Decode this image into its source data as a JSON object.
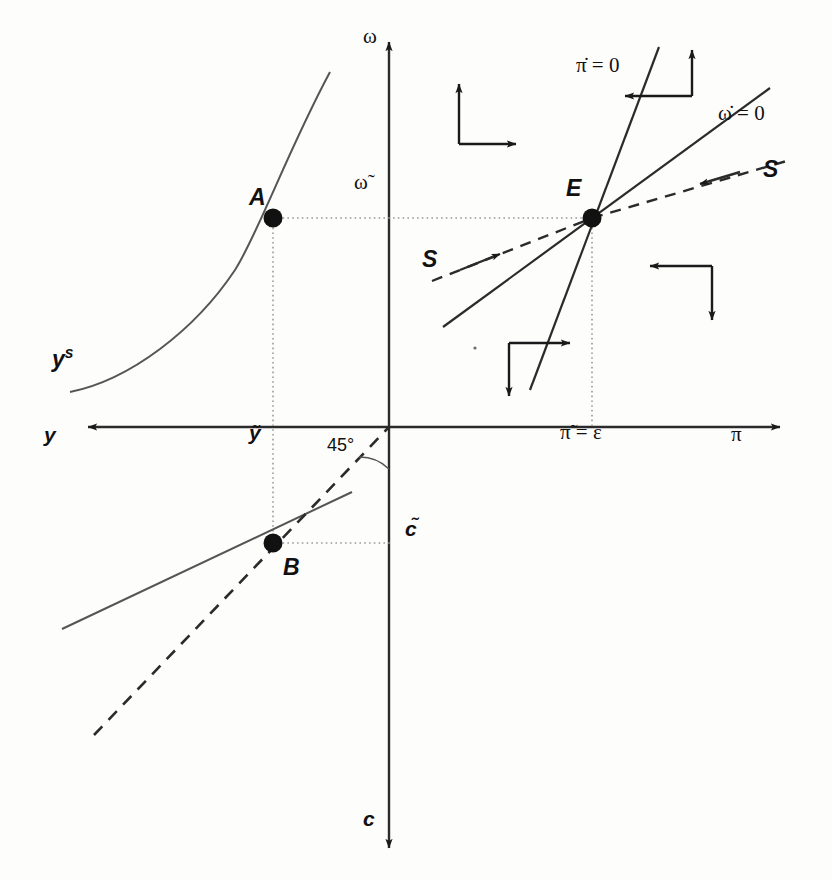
{
  "figure": {
    "type": "phase-diagram"
  },
  "axes": [
    {
      "id": "y",
      "label": "y",
      "direction": "left",
      "label_x": 44,
      "label_y": 434
    },
    {
      "id": "pi",
      "label": "π",
      "direction": "right",
      "label_x": 731,
      "label_y": 434
    },
    {
      "id": "omega",
      "label": "ω",
      "direction": "up",
      "label_x": 363,
      "label_y": 36
    },
    {
      "id": "c",
      "label": "c",
      "direction": "down",
      "label_x": 363,
      "label_y": 818
    }
  ],
  "ticks": [
    {
      "id": "y-tilde",
      "label": "ỹ",
      "x": 249,
      "y": 432
    },
    {
      "id": "pi-tilde",
      "label": "π̃ = ε",
      "x": 560,
      "y": 432
    },
    {
      "id": "omega-tilde",
      "label": "ω̃",
      "x": 354,
      "y": 180
    },
    {
      "id": "c-tilde",
      "label": "c̃",
      "x": 405,
      "y": 518
    }
  ],
  "points": [
    {
      "id": "A",
      "label": "A",
      "cx": 273,
      "cy": 218,
      "label_x": 249,
      "label_y": 186
    },
    {
      "id": "B",
      "label": "B",
      "cx": 273,
      "cy": 543,
      "label_x": 283,
      "label_y": 556
    },
    {
      "id": "E",
      "label": "E",
      "cx": 592,
      "cy": 218,
      "label_x": 566,
      "label_y": 177
    }
  ],
  "curves": [
    {
      "id": "y-supply",
      "label": "y",
      "superscript": "s",
      "label_x": 52,
      "label_y": 345,
      "style": "solid"
    },
    {
      "id": "pi-dot-nullcline",
      "label": "π̇ = 0",
      "label_x": 576,
      "label_y": 55,
      "style": "solid"
    },
    {
      "id": "omega-dot-nullcline",
      "label": "ω̇ = 0",
      "label_x": 718,
      "label_y": 103,
      "style": "solid"
    },
    {
      "id": "saddle-path-right",
      "label": "S",
      "label_x": 763,
      "label_y": 158,
      "style": "dashed"
    },
    {
      "id": "saddle-path-left",
      "label": "S",
      "label_x": 422,
      "label_y": 248,
      "style": "dashed"
    }
  ],
  "annotations": [
    {
      "id": "angle-45",
      "label": "45°",
      "x": 327,
      "y": 436
    }
  ],
  "phase_arrows": [
    {
      "id": "quadrant-upper-left",
      "horizontal": "right",
      "vertical": "up",
      "corner_x": 459,
      "corner_y": 144,
      "arm": 46
    },
    {
      "id": "quadrant-upper-right",
      "horizontal": "left",
      "vertical": "up",
      "corner_x": 692,
      "corner_y": 96,
      "arm": 46
    },
    {
      "id": "quadrant-lower-right",
      "horizontal": "left",
      "vertical": "down",
      "corner_x": 712,
      "corner_y": 266,
      "arm": 46
    },
    {
      "id": "quadrant-lower-left",
      "horizontal": "right",
      "vertical": "down",
      "corner_x": 509,
      "corner_y": 343,
      "arm": 46
    }
  ],
  "colors": {
    "ink": "#1a1a1a",
    "line": "#3a3a3a",
    "dotted_guide": "#9a9a9a",
    "background": "#fdfdfc"
  }
}
